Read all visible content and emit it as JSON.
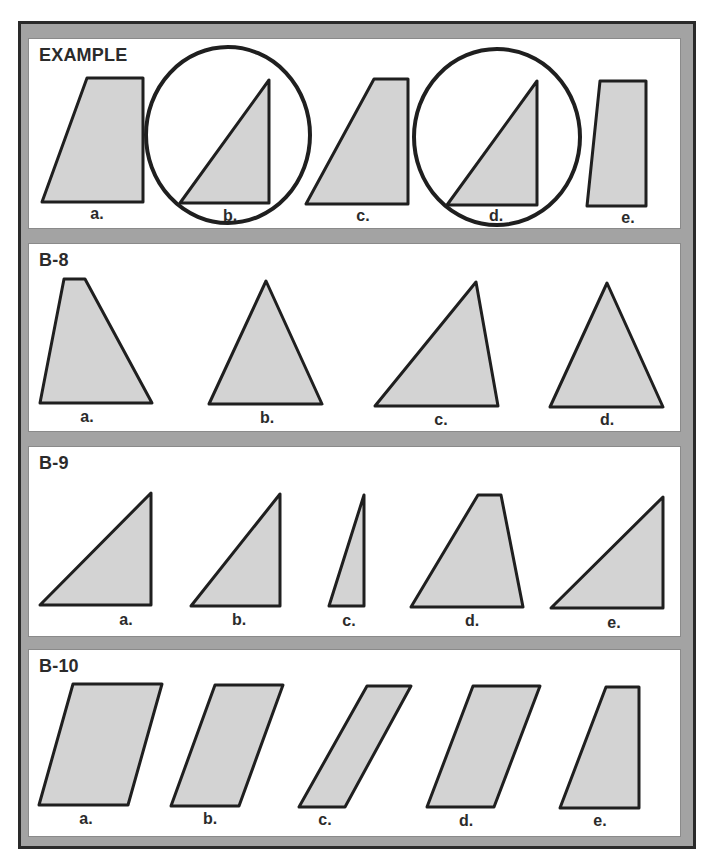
{
  "sheet": {
    "colors": {
      "frame": "#a3a3a3",
      "shape_fill": "#d3d3d3",
      "stroke": "#1f1f1f",
      "text": "#2b2b2b"
    },
    "panels": [
      {
        "title": "EXAMPLE",
        "items": [
          {
            "label": "a.",
            "shape": "right-trapezoid",
            "circled": false
          },
          {
            "label": "b.",
            "shape": "right-triangle",
            "circled": true
          },
          {
            "label": "c.",
            "shape": "right-trapezoid",
            "circled": false
          },
          {
            "label": "d.",
            "shape": "right-triangle",
            "circled": true
          },
          {
            "label": "e.",
            "shape": "right-trapezoid",
            "circled": false
          }
        ]
      },
      {
        "title": "B-8",
        "items": [
          {
            "label": "a.",
            "shape": "trapezoid"
          },
          {
            "label": "b.",
            "shape": "triangle"
          },
          {
            "label": "c.",
            "shape": "triangle"
          },
          {
            "label": "d.",
            "shape": "triangle"
          }
        ]
      },
      {
        "title": "B-9",
        "items": [
          {
            "label": "a.",
            "shape": "right-triangle"
          },
          {
            "label": "b.",
            "shape": "right-triangle"
          },
          {
            "label": "c.",
            "shape": "right-triangle"
          },
          {
            "label": "d.",
            "shape": "trapezoid"
          },
          {
            "label": "e.",
            "shape": "right-triangle"
          }
        ]
      },
      {
        "title": "B-10",
        "items": [
          {
            "label": "a.",
            "shape": "parallelogram"
          },
          {
            "label": "b.",
            "shape": "parallelogram"
          },
          {
            "label": "c.",
            "shape": "parallelogram"
          },
          {
            "label": "d.",
            "shape": "parallelogram"
          },
          {
            "label": "e.",
            "shape": "right-trapezoid"
          }
        ]
      }
    ]
  }
}
